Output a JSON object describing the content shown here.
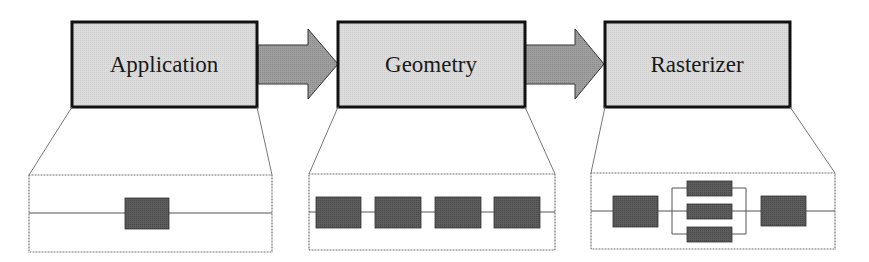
{
  "diagram": {
    "type": "pipeline",
    "colors": {
      "stage_fill": "#d9d9d9",
      "stage_border": "#111111",
      "arrow_fill": "#9a9a9a",
      "block_fill": "#5a5a5a",
      "line": "#555555"
    },
    "stages": [
      {
        "label": "Application",
        "detail": {
          "layout": "single",
          "block_count": 1
        }
      },
      {
        "label": "Geometry",
        "detail": {
          "layout": "serial",
          "block_count": 4
        }
      },
      {
        "label": "Rasterizer",
        "detail": {
          "layout": "serial-parallel-serial",
          "block_count": 5
        }
      }
    ],
    "arrows": [
      {
        "from": "Application",
        "to": "Geometry"
      },
      {
        "from": "Geometry",
        "to": "Rasterizer"
      }
    ]
  }
}
